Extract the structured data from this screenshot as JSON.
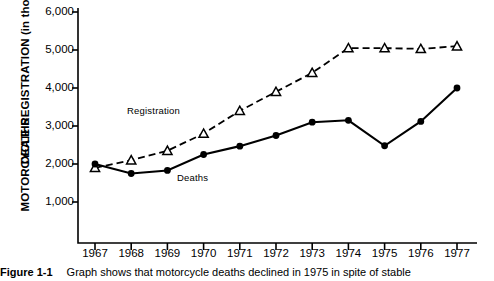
{
  "figure": {
    "caption_number": "Figure 1-1",
    "caption_text": "Graph shows that motorcycle deaths declined in 1975 in spite of stable"
  },
  "axis": {
    "y_title_line1": "MOTORCYCLE REGISTRATION (in thousands)",
    "y_title_line2": "DEATHS",
    "y_ticks": [
      "6,000",
      "5,000",
      "4,000",
      "3,000",
      "2,000",
      "1,000"
    ],
    "x_ticks": [
      "1967",
      "1968",
      "1969",
      "1970",
      "1971",
      "1972",
      "1973",
      "1974",
      "1975",
      "1976",
      "1977"
    ]
  },
  "annotations": {
    "registration_label": "Registration",
    "deaths_label": "Deaths"
  },
  "colors": {
    "ink": "#000000",
    "background": "#ffffff"
  },
  "chart_data": {
    "type": "line",
    "title": "",
    "xlabel": "",
    "ylabel": "MOTORCYCLE REGISTRATION (in thousands) / DEATHS",
    "x": [
      1967,
      1968,
      1969,
      1970,
      1971,
      1972,
      1973,
      1974,
      1975,
      1976,
      1977
    ],
    "categories": [
      "1967",
      "1968",
      "1969",
      "1970",
      "1971",
      "1972",
      "1973",
      "1974",
      "1975",
      "1976",
      "1977"
    ],
    "ylim": [
      0,
      6000
    ],
    "y_tick_values": [
      1000,
      2000,
      3000,
      4000,
      5000,
      6000
    ],
    "grid": false,
    "legend": "inline-annotations",
    "series": [
      {
        "name": "Registration",
        "marker": "open-triangle",
        "linestyle": "dashed",
        "values": [
          1900,
          2100,
          2350,
          2800,
          3400,
          3900,
          4400,
          5050,
          5050,
          5030,
          5100
        ]
      },
      {
        "name": "Deaths",
        "marker": "filled-circle",
        "linestyle": "solid",
        "values": [
          2000,
          1750,
          1830,
          2250,
          2470,
          2750,
          3100,
          3150,
          2480,
          3120,
          4000
        ]
      }
    ]
  }
}
